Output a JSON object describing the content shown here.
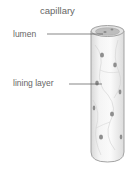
{
  "title": "capillary",
  "labels": {
    "lumen": "lumen",
    "lining_layer": "lining layer"
  },
  "colors": {
    "tube_fill": "#f2f2f2",
    "tube_outline": "#9a9a9a",
    "nucleus": "#8a8a8a",
    "leader_line": "#555555",
    "text": "#666666"
  }
}
